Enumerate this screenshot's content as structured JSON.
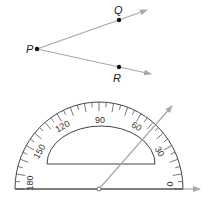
{
  "figure": {
    "points": [
      {
        "label": "P",
        "x": 37,
        "y": 49
      },
      {
        "label": "Q",
        "x": 119,
        "y": 20
      },
      {
        "label": "R",
        "x": 119,
        "y": 67
      }
    ],
    "rays": [
      {
        "from": "P",
        "through": "Q"
      },
      {
        "from": "P",
        "through": "R"
      }
    ]
  },
  "protractor": {
    "scale_labels": [
      "180",
      "150",
      "120",
      "90",
      "60",
      "30",
      "0"
    ],
    "measuring_ray_angle_deg": 48
  },
  "colors": {
    "ray": "#a8a8a8",
    "ink": "#1a1a1a",
    "protractor_line": "#444444"
  }
}
